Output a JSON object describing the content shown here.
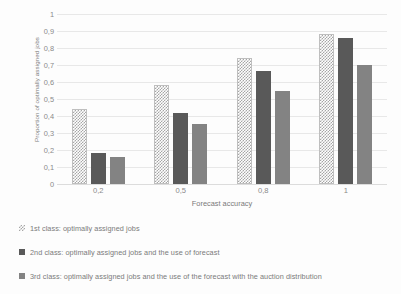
{
  "chart_data": {
    "type": "bar",
    "title": "",
    "xlabel": "Forecast accuracy",
    "ylabel": "Proportion of optimally assigned jobs",
    "categories": [
      "0,2",
      "0,5",
      "0,8",
      "1"
    ],
    "ylim": [
      0,
      1
    ],
    "yticks": [
      "0",
      "0,1",
      "0,2",
      "0,3",
      "0,4",
      "0,5",
      "0,6",
      "0,7",
      "0,8",
      "0,9",
      "1"
    ],
    "ytick_values": [
      0,
      0.1,
      0.2,
      0.3,
      0.4,
      0.5,
      0.6,
      0.7,
      0.8,
      0.9,
      1
    ],
    "grid": true,
    "legend_position": "bottom",
    "series": [
      {
        "name": "1st class: optimally assigned jobs",
        "pattern": "checkered",
        "color": "#a6a6a6",
        "values": [
          0.44,
          0.58,
          0.74,
          0.88
        ]
      },
      {
        "name": "2nd class: optimally assigned jobs and the use of forecast",
        "pattern": "solid",
        "color": "#595959",
        "values": [
          0.18,
          0.415,
          0.665,
          0.86
        ]
      },
      {
        "name": "3rd class: optimally assigned jobs and the use of the forecast with the auction distribution",
        "pattern": "solid",
        "color": "#838383",
        "values": [
          0.16,
          0.355,
          0.545,
          0.7
        ]
      }
    ]
  }
}
